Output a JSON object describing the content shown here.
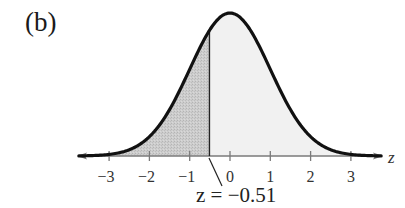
{
  "panel_label": "(b)",
  "colors": {
    "curve": "#111111",
    "axis": "#7a7a7a",
    "shaded_left": "#c9c9c9",
    "shaded_right": "#f1f1f1",
    "text": "#222222"
  },
  "chart_data": {
    "type": "area",
    "title": "(b)",
    "xlabel": "z",
    "ylabel": "",
    "xlim": [
      -3.6,
      3.6
    ],
    "x_ticks": [
      -3,
      -2,
      -1,
      0,
      1,
      2,
      3
    ],
    "x_tick_labels": [
      "−3",
      "−2",
      "−1",
      "0",
      "1",
      "2",
      "3"
    ],
    "distribution": {
      "name": "standard normal",
      "mean": 0,
      "sd": 1
    },
    "marker": {
      "z": -0.51,
      "label": "z = −0.51"
    },
    "regions": [
      {
        "name": "left-of-z",
        "from": -3.6,
        "to": -0.51,
        "fill": "dark gray (stippled)"
      },
      {
        "name": "right-of-z",
        "from": -0.51,
        "to": 3.6,
        "fill": "light gray"
      }
    ],
    "grid": false,
    "legend": null
  },
  "axis": {
    "label": "z",
    "ticks": [
      {
        "value": -3,
        "label": "−3"
      },
      {
        "value": -2,
        "label": "−2"
      },
      {
        "value": -1,
        "label": "−1"
      },
      {
        "value": 0,
        "label": "0"
      },
      {
        "value": 1,
        "label": "1"
      },
      {
        "value": 2,
        "label": "2"
      },
      {
        "value": 3,
        "label": "3"
      }
    ]
  },
  "annotation": {
    "text": "z = −0.51"
  }
}
